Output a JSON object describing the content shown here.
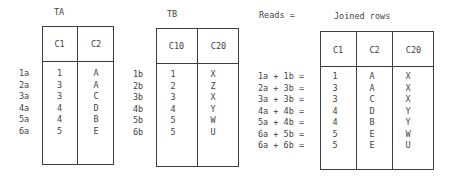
{
  "table_a": {
    "title": "TA",
    "headers": [
      "C1",
      "C2"
    ],
    "row_labels": [
      "1a",
      "2a",
      "3a",
      "4a",
      "5a",
      "6a"
    ],
    "columns": [
      [
        "1",
        "3",
        "3",
        "4",
        "4",
        "5"
      ],
      [
        "A",
        "A",
        "C",
        "D",
        "B",
        "E"
      ]
    ]
  },
  "table_b": {
    "title": "TB",
    "headers": [
      "C10",
      "C20"
    ],
    "row_labels": [
      "1b",
      "2b",
      "3b",
      "4b",
      "5b",
      "6b"
    ],
    "columns": [
      [
        "1",
        "2",
        "3",
        "4",
        "5",
        "5"
      ],
      [
        "X",
        "Z",
        "X",
        "Y",
        "W",
        "U"
      ]
    ]
  },
  "joined": {
    "reads_label": "Reads =",
    "title": "Joined rows",
    "headers": [
      "C1",
      "C2",
      "C20"
    ],
    "row_labels": [
      "1a + 1b =",
      "2a + 3b =",
      "3a + 3b =",
      "4a + 4b =",
      "5a + 4b =",
      "6a + 5b =",
      "6a + 6b ="
    ],
    "columns": [
      [
        "1",
        "3",
        "3",
        "4",
        "4",
        "5",
        "5"
      ],
      [
        "A",
        "A",
        "C",
        "D",
        "B",
        "E",
        "E"
      ],
      [
        "X",
        "X",
        "X",
        "Y",
        "Y",
        "W",
        "U"
      ]
    ]
  }
}
